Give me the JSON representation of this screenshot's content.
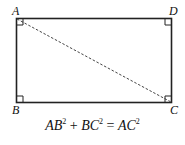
{
  "figure": {
    "type": "rectangle-with-diagonal",
    "vertices": {
      "A": {
        "label": "A",
        "position": "top-left"
      },
      "B": {
        "label": "B",
        "position": "bottom-left"
      },
      "C": {
        "label": "C",
        "position": "bottom-right"
      },
      "D": {
        "label": "D",
        "position": "top-right"
      }
    },
    "diagonal": {
      "from": "A",
      "to": "C",
      "style": "dashed"
    },
    "right_angle_marks": [
      "A",
      "B",
      "C",
      "D"
    ]
  },
  "equation": {
    "term1_base": "AB",
    "term1_exp": "2",
    "plus": "+",
    "term2_base": "BC",
    "term2_exp": "2",
    "equals": "=",
    "term3_base": "AC",
    "term3_exp": "2"
  }
}
